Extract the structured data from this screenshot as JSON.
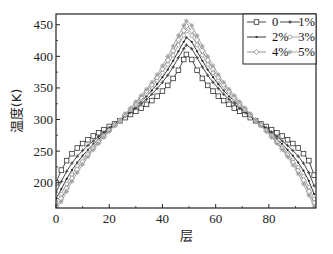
{
  "chart_data": {
    "type": "line",
    "title": "",
    "xlabel": "层",
    "ylabel": "温度(K)",
    "xlim": [
      0,
      97.7
    ],
    "ylim": [
      160,
      467
    ],
    "xticks": [
      0,
      20,
      40,
      60,
      80
    ],
    "yticks": [
      200,
      250,
      300,
      350,
      400,
      450
    ],
    "grid": false,
    "legend_position": "upper right",
    "x": [
      0,
      2,
      4,
      6,
      8,
      10,
      12,
      14,
      16,
      18,
      20,
      22,
      24,
      26,
      28,
      30,
      32,
      34,
      36,
      38,
      40,
      42,
      44,
      46,
      48,
      49,
      51,
      53,
      55,
      57,
      59,
      61,
      63,
      65,
      67,
      69,
      71,
      73,
      75,
      77,
      79,
      81,
      83,
      85,
      87,
      89,
      91,
      93,
      95,
      97
    ],
    "series": [
      {
        "name": "0",
        "marker": "open-square",
        "color": "#333333",
        "values": [
          200,
          220,
          235,
          246,
          255,
          262,
          268,
          274,
          279,
          284,
          289,
          293,
          298,
          303,
          308,
          313,
          318,
          324,
          330,
          337,
          345,
          354,
          365,
          378,
          395,
          403,
          395,
          378,
          365,
          354,
          345,
          337,
          330,
          324,
          318,
          313,
          308,
          303,
          298,
          293,
          289,
          284,
          279,
          274,
          268,
          262,
          255,
          246,
          235,
          212
        ]
      },
      {
        "name": "1%",
        "marker": "small-cross",
        "color": "#333333",
        "values": [
          185,
          202,
          218,
          231,
          242,
          251,
          259,
          266,
          273,
          280,
          287,
          293,
          299,
          305,
          311,
          318,
          325,
          332,
          340,
          349,
          359,
          370,
          383,
          398,
          412,
          418,
          412,
          398,
          383,
          370,
          359,
          349,
          340,
          332,
          325,
          318,
          311,
          305,
          299,
          293,
          287,
          280,
          273,
          266,
          259,
          251,
          242,
          231,
          216,
          195
        ]
      },
      {
        "name": "2%",
        "marker": "dot",
        "color": "#222222",
        "values": [
          175,
          190,
          206,
          220,
          232,
          243,
          252,
          261,
          269,
          277,
          285,
          292,
          299,
          306,
          313,
          321,
          329,
          337,
          346,
          356,
          367,
          379,
          393,
          408,
          423,
          430,
          423,
          408,
          393,
          379,
          367,
          356,
          346,
          337,
          329,
          321,
          313,
          306,
          299,
          292,
          285,
          277,
          269,
          261,
          252,
          243,
          232,
          219,
          203,
          182
        ]
      },
      {
        "name": "3%",
        "marker": "open-circle",
        "color": "#9a9a9a",
        "values": [
          168,
          182,
          198,
          213,
          226,
          237,
          247,
          257,
          266,
          275,
          283,
          291,
          299,
          307,
          315,
          323,
          332,
          341,
          351,
          362,
          374,
          387,
          402,
          418,
          433,
          440,
          433,
          418,
          402,
          387,
          374,
          362,
          351,
          341,
          332,
          323,
          315,
          307,
          299,
          291,
          283,
          275,
          266,
          257,
          247,
          236,
          224,
          210,
          193,
          174
        ]
      },
      {
        "name": "4%",
        "marker": "open-diamond",
        "color": "#8a8a8a",
        "values": [
          162,
          175,
          191,
          207,
          221,
          233,
          244,
          254,
          264,
          273,
          282,
          291,
          299,
          308,
          317,
          326,
          335,
          345,
          355,
          367,
          380,
          394,
          409,
          426,
          441,
          448,
          441,
          426,
          409,
          394,
          380,
          367,
          355,
          345,
          335,
          326,
          317,
          308,
          299,
          291,
          282,
          273,
          264,
          254,
          244,
          232,
          219,
          204,
          186,
          168
        ]
      },
      {
        "name": "5%",
        "marker": "star",
        "color": "#a0a0a0",
        "values": [
          158,
          170,
          186,
          202,
          216,
          229,
          241,
          252,
          262,
          272,
          281,
          290,
          299,
          309,
          318,
          328,
          338,
          348,
          359,
          371,
          385,
          400,
          416,
          433,
          449,
          456,
          449,
          433,
          416,
          400,
          385,
          371,
          359,
          348,
          338,
          328,
          318,
          309,
          299,
          290,
          281,
          272,
          262,
          252,
          241,
          228,
          214,
          198,
          180,
          163
        ]
      }
    ]
  },
  "plot": {
    "left": 56,
    "top": 14,
    "right": 316,
    "bottom": 208
  },
  "axes": {
    "xlabel": "层",
    "ylabel": "温度(K)",
    "xtick_labels": [
      "0",
      "20",
      "40",
      "60",
      "80"
    ],
    "ytick_labels": [
      "200",
      "250",
      "300",
      "350",
      "400",
      "450"
    ]
  },
  "legend": {
    "entries": [
      "0",
      "1%",
      "2%",
      "3%",
      "4%",
      "5%"
    ]
  }
}
